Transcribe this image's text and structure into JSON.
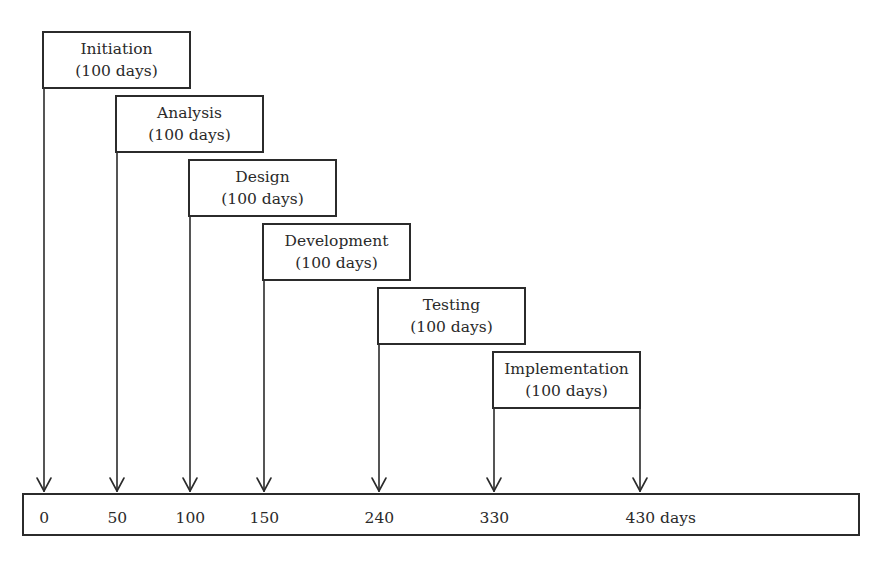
{
  "diagram": {
    "type": "phase-timeline",
    "phases": [
      {
        "name": "Initiation",
        "duration": "(100 days)",
        "start": 0
      },
      {
        "name": "Analysis",
        "duration": "(100 days)",
        "start": 50
      },
      {
        "name": "Design",
        "duration": "(100 days)",
        "start": 100
      },
      {
        "name": "Development",
        "duration": "(100 days)",
        "start": 150
      },
      {
        "name": "Testing",
        "duration": "(100 days)",
        "start": 240
      },
      {
        "name": "Implementation",
        "duration": "(100 days)",
        "start": 330,
        "end": 430
      }
    ],
    "timeline": {
      "ticks": [
        {
          "value": 0,
          "label": "0"
        },
        {
          "value": 50,
          "label": "50"
        },
        {
          "value": 100,
          "label": "100"
        },
        {
          "value": 150,
          "label": "150"
        },
        {
          "value": 240,
          "label": "240"
        },
        {
          "value": 330,
          "label": "330"
        },
        {
          "value": 430,
          "label": "430 days"
        }
      ]
    }
  }
}
